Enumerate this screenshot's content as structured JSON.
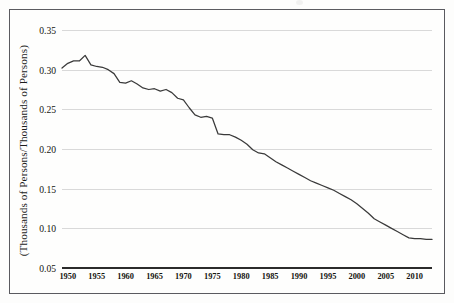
{
  "figure": {
    "background_color": "#fdfdfc",
    "frame_color": "#5a5a5f"
  },
  "chart_data": {
    "type": "line",
    "title": "",
    "xlabel": "",
    "ylabel": "(Thousands of Persons/Thousands of Persons)",
    "xlim": [
      1949,
      2013
    ],
    "ylim": [
      0.05,
      0.35
    ],
    "ytick_labels": [
      "0.35",
      "0.30",
      "0.25",
      "0.20",
      "0.15",
      "0.10",
      "0.05"
    ],
    "ytick_values": [
      0.35,
      0.3,
      0.25,
      0.2,
      0.15,
      0.1,
      0.05
    ],
    "xtick_labels": [
      "1950",
      "1955",
      "1960",
      "1965",
      "1970",
      "1975",
      "1980",
      "1985",
      "1990",
      "1995",
      "2000",
      "2005",
      "2010"
    ],
    "xtick_values": [
      1950,
      1955,
      1960,
      1965,
      1970,
      1975,
      1980,
      1985,
      1990,
      1995,
      2000,
      2005,
      2010
    ],
    "grid": true,
    "legend": false,
    "line_color": "#3a3a3a",
    "series": [
      {
        "name": "ratio",
        "x": [
          1949,
          1950,
          1951,
          1952,
          1953,
          1954,
          1955,
          1956,
          1957,
          1958,
          1959,
          1960,
          1961,
          1962,
          1963,
          1964,
          1965,
          1966,
          1967,
          1968,
          1969,
          1970,
          1971,
          1972,
          1973,
          1974,
          1975,
          1976,
          1977,
          1978,
          1979,
          1980,
          1981,
          1982,
          1983,
          1984,
          1985,
          1986,
          1987,
          1988,
          1989,
          1990,
          1991,
          1992,
          1993,
          1994,
          1995,
          1996,
          1997,
          1998,
          1999,
          2000,
          2001,
          2002,
          2003,
          2004,
          2005,
          2006,
          2007,
          2008,
          2009,
          2010,
          2011,
          2012,
          2013
        ],
        "values": [
          0.302,
          0.308,
          0.311,
          0.311,
          0.318,
          0.306,
          0.304,
          0.303,
          0.3,
          0.295,
          0.284,
          0.283,
          0.286,
          0.282,
          0.277,
          0.275,
          0.276,
          0.273,
          0.275,
          0.271,
          0.264,
          0.262,
          0.252,
          0.243,
          0.24,
          0.241,
          0.239,
          0.219,
          0.218,
          0.218,
          0.215,
          0.211,
          0.206,
          0.199,
          0.195,
          0.194,
          0.189,
          0.184,
          0.18,
          0.176,
          0.172,
          0.168,
          0.164,
          0.16,
          0.157,
          0.154,
          0.151,
          0.148,
          0.144,
          0.14,
          0.136,
          0.131,
          0.125,
          0.119,
          0.112,
          0.108,
          0.104,
          0.1,
          0.096,
          0.092,
          0.088,
          0.087,
          0.087,
          0.086,
          0.086
        ]
      }
    ]
  }
}
